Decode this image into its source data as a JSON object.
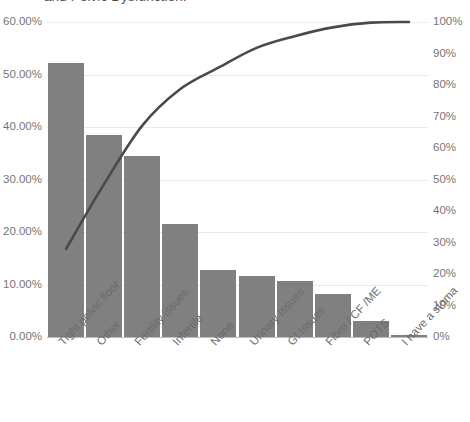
{
  "chart": {
    "title": "and Pelvic Dysfunction:"
  },
  "colors": {
    "bar": "#808080",
    "line": "#4a4a4a",
    "grid": "#e9e9e9",
    "text": "#767676"
  },
  "chart_data": {
    "type": "bar",
    "title": "and Pelvic Dysfunction:",
    "xlabel": "",
    "ylabel": "",
    "grid": true,
    "legend": false,
    "categories": [
      "Tight pelvic floor",
      "Other",
      "Fertility issues",
      "Infertile",
      "None",
      "Urinary Issues",
      "GI Issues",
      "Fibro / CF /ME",
      "POTS",
      "I have a stoma"
    ],
    "series": [
      {
        "name": "Percent",
        "type": "bar",
        "axis": "left",
        "values": [
          52.2,
          38.5,
          34.4,
          21.6,
          12.8,
          11.7,
          10.6,
          8.2,
          3.1,
          0.4
        ],
        "value_labels": [
          "52.20%",
          "38.50%",
          "34.40%",
          "21.60%",
          "12.80%",
          "11.70%",
          "10.60%",
          "8.20%",
          "3.10%",
          "0.40%"
        ]
      },
      {
        "name": "Cumulative %",
        "type": "line",
        "axis": "right",
        "values": [
          28.0,
          48.6,
          67.1,
          78.7,
          85.5,
          91.8,
          95.5,
          98.3,
          99.8,
          100.0
        ],
        "value_labels": [
          "28%",
          "49%",
          "67%",
          "79%",
          "86%",
          "92%",
          "96%",
          "98%",
          "100%",
          "100%"
        ]
      }
    ],
    "left_axis": {
      "label": "",
      "min": 0,
      "max": 60,
      "step": 10,
      "ticks": [
        "0.00%",
        "10.00%",
        "20.00%",
        "30.00%",
        "40.00%",
        "50.00%",
        "60.00%"
      ]
    },
    "right_axis": {
      "label": "",
      "min": 0,
      "max": 100,
      "step": 10,
      "ticks": [
        "0%",
        "10%",
        "20%",
        "30%",
        "40%",
        "50%",
        "60%",
        "70%",
        "80%",
        "90%",
        "100%"
      ]
    }
  }
}
